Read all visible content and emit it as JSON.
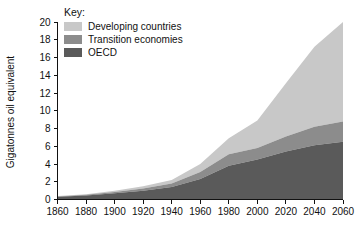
{
  "chart_data": {
    "type": "area",
    "stacked": true,
    "title": "",
    "xlabel": "",
    "ylabel": "Gigatonnes oil equivalent",
    "xlim": [
      1860,
      2060
    ],
    "ylim": [
      0,
      20
    ],
    "xticks": [
      1860,
      1880,
      1900,
      1920,
      1940,
      1960,
      1980,
      2000,
      2020,
      2040,
      2060
    ],
    "yticks": [
      0,
      2,
      4,
      6,
      8,
      10,
      12,
      14,
      16,
      18,
      20
    ],
    "grid": false,
    "legend_position": "top-left-inside",
    "legend_title": "Key:",
    "x": [
      1860,
      1880,
      1900,
      1920,
      1940,
      1960,
      1980,
      2000,
      2020,
      2040,
      2060
    ],
    "series": [
      {
        "name": "OECD",
        "color": "#5a5a5a",
        "values": [
          0.3,
          0.45,
          0.7,
          1.0,
          1.4,
          2.3,
          3.8,
          4.5,
          5.4,
          6.1,
          6.5
        ]
      },
      {
        "name": "Transition economies",
        "color": "#8c8c8c",
        "values": [
          0.05,
          0.08,
          0.15,
          0.25,
          0.4,
          0.8,
          1.3,
          1.3,
          1.7,
          2.1,
          2.3
        ]
      },
      {
        "name": "Developing countries",
        "color": "#c8c8c8",
        "values": [
          0.05,
          0.07,
          0.15,
          0.25,
          0.4,
          0.9,
          1.8,
          3.1,
          6.0,
          9.0,
          11.2
        ]
      }
    ],
    "stack_order_bottom_to_top": [
      "OECD",
      "Transition economies",
      "Developing countries"
    ],
    "totals": [
      0.4,
      0.6,
      1.0,
      1.5,
      2.2,
      4.0,
      6.9,
      8.9,
      13.1,
      17.2,
      20.0
    ]
  },
  "legend": {
    "title": "Key:",
    "items": [
      {
        "label": "Developing countries",
        "color": "#c8c8c8"
      },
      {
        "label": "Transition economies",
        "color": "#8c8c8c"
      },
      {
        "label": "OECD",
        "color": "#5a5a5a"
      }
    ]
  },
  "axes": {
    "y_title": "Gigatonnes oil equivalent",
    "x_tick_labels": [
      "1860",
      "1880",
      "1900",
      "1920",
      "1940",
      "1960",
      "1980",
      "2000",
      "2020",
      "2040",
      "2060"
    ],
    "y_tick_labels": [
      "0",
      "2",
      "4",
      "6",
      "8",
      "10",
      "12",
      "14",
      "16",
      "18",
      "20"
    ]
  },
  "colors": {
    "axis": "#111111",
    "background": "#ffffff",
    "developing": "#c8c8c8",
    "transition": "#8c8c8c",
    "oecd": "#5a5a5a"
  }
}
